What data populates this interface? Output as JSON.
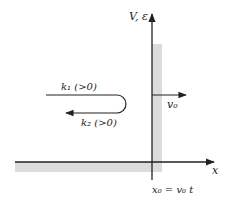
{
  "diagram": {
    "axes": {
      "x_label": "x",
      "y_label": "V, ε",
      "origin_label": "x₀ = v₀ t"
    },
    "wall": {
      "velocity_label": "v₀",
      "shade_color": "#dcdcdc"
    },
    "waves": {
      "incident_label": "k₁ (>0)",
      "reflected_label": "k₂ (>0)"
    },
    "colors": {
      "line": "#222222",
      "shade": "#dcdcdc",
      "background": "#ffffff"
    }
  }
}
